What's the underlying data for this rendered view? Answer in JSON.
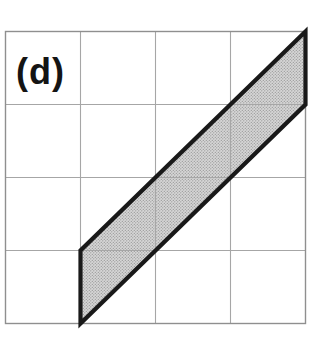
{
  "figure": {
    "label": "(d)",
    "grid": {
      "rows": 4,
      "cols": 4
    },
    "parallelogram": {
      "vertices_grid_units": [
        [
          4,
          0
        ],
        [
          4,
          1
        ],
        [
          1,
          4
        ],
        [
          1,
          3
        ]
      ],
      "fill_style": "stippled-halftone-gray"
    },
    "colors": {
      "background": "#ffffff",
      "grid_line": "#a6a6a6",
      "grid_border": "#8f8f8f",
      "shape_fill_base": "#d6d6d6",
      "shape_fill_dot": "#8f8f8f",
      "shape_outline": "#191919",
      "label": "#141414"
    }
  }
}
